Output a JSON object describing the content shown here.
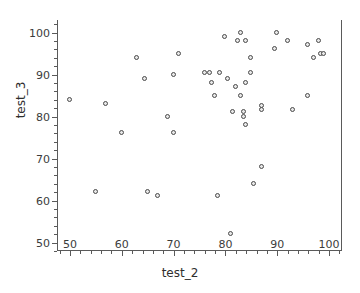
{
  "chart_data": {
    "type": "scatter",
    "title": "",
    "xlabel": "test_2",
    "ylabel": "test_3",
    "xlim": [
      47.5,
      102.5
    ],
    "ylim": [
      48,
      103
    ],
    "grid": false,
    "legend": null,
    "xticks": [
      50,
      60,
      70,
      80,
      90,
      100
    ],
    "yticks": [
      50,
      60,
      70,
      80,
      90,
      100
    ],
    "xticklabels": [
      "50",
      "60",
      "70",
      "80",
      "90",
      "100"
    ],
    "yticklabels": [
      "50",
      "60",
      "70",
      "80",
      "90",
      "100"
    ],
    "x_minor_interval": 2,
    "y_minor_interval": 2,
    "marker": "open-circle",
    "marker_color": "#4a4a4a",
    "marker_fill": "#e8e8e8",
    "axis_color": "#5a5a5a",
    "background": "#ffffff",
    "points": [
      {
        "x": 50.0,
        "y": 84.0
      },
      {
        "x": 55.0,
        "y": 62.0
      },
      {
        "x": 57.0,
        "y": 83.0
      },
      {
        "x": 60.0,
        "y": 76.0
      },
      {
        "x": 63.0,
        "y": 94.0
      },
      {
        "x": 64.5,
        "y": 89.0
      },
      {
        "x": 65.0,
        "y": 62.0
      },
      {
        "x": 67.0,
        "y": 61.0
      },
      {
        "x": 69.0,
        "y": 80.0
      },
      {
        "x": 70.0,
        "y": 76.0
      },
      {
        "x": 70.0,
        "y": 90.0
      },
      {
        "x": 71.0,
        "y": 95.0
      },
      {
        "x": 76.0,
        "y": 90.5
      },
      {
        "x": 77.0,
        "y": 90.5
      },
      {
        "x": 77.5,
        "y": 88.0
      },
      {
        "x": 78.0,
        "y": 85.0
      },
      {
        "x": 78.5,
        "y": 61.0
      },
      {
        "x": 79.0,
        "y": 90.5
      },
      {
        "x": 80.0,
        "y": 99.0
      },
      {
        "x": 80.5,
        "y": 89.0
      },
      {
        "x": 81.0,
        "y": 52.0
      },
      {
        "x": 81.5,
        "y": 81.0
      },
      {
        "x": 82.0,
        "y": 87.0
      },
      {
        "x": 82.5,
        "y": 98.0
      },
      {
        "x": 83.0,
        "y": 100.0
      },
      {
        "x": 83.0,
        "y": 85.0
      },
      {
        "x": 83.5,
        "y": 81.0
      },
      {
        "x": 83.5,
        "y": 80.0
      },
      {
        "x": 84.0,
        "y": 98.0
      },
      {
        "x": 84.0,
        "y": 88.0
      },
      {
        "x": 84.0,
        "y": 78.0
      },
      {
        "x": 85.0,
        "y": 94.0
      },
      {
        "x": 85.0,
        "y": 90.5
      },
      {
        "x": 85.5,
        "y": 64.0
      },
      {
        "x": 87.0,
        "y": 82.5
      },
      {
        "x": 87.0,
        "y": 81.5
      },
      {
        "x": 87.0,
        "y": 68.0
      },
      {
        "x": 89.5,
        "y": 96.0
      },
      {
        "x": 90.0,
        "y": 100.0
      },
      {
        "x": 92.0,
        "y": 98.0
      },
      {
        "x": 93.0,
        "y": 81.5
      },
      {
        "x": 96.0,
        "y": 85.0
      },
      {
        "x": 96.0,
        "y": 97.0
      },
      {
        "x": 97.0,
        "y": 94.0
      },
      {
        "x": 98.0,
        "y": 98.0
      },
      {
        "x": 98.5,
        "y": 95.0
      },
      {
        "x": 99.0,
        "y": 95.0
      }
    ]
  }
}
